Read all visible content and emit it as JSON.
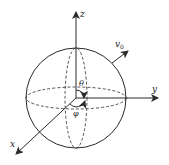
{
  "diagram": {
    "axes": {
      "z": "z",
      "y": "y",
      "x": "x"
    },
    "velocity_label": "v",
    "velocity_subscript": "0",
    "angle_polar": "θ",
    "angle_azimuth": "φ",
    "colors": {
      "stroke": "#2a2a2a",
      "background": "#ffffff"
    }
  }
}
